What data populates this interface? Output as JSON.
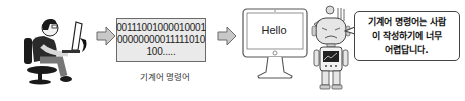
{
  "diagram": {
    "binary_code": {
      "lines": [
        "00111001000010001",
        "00000000011111010",
        "100....."
      ]
    },
    "binary_caption": "기계어 명령어",
    "monitor_text": "Hello",
    "speech_bubble": {
      "lines": [
        "기계어 명령어는 사람",
        "이 작성하기에 너무",
        "어렵답니다."
      ]
    },
    "colors": {
      "arrow_fill": "#c8c8c8",
      "arrow_stroke": "#6a6a6a",
      "box_fill": "#eaeaea",
      "outline": "#444444"
    }
  }
}
